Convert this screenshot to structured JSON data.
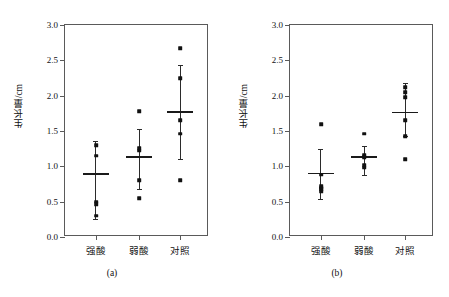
{
  "figure": {
    "ylabel": "生长量/cm",
    "categories": [
      "强酸",
      "弱酸",
      "对照"
    ],
    "yticks": [
      "0.0",
      "0.5",
      "1.0",
      "1.5",
      "2.0",
      "2.5",
      "3.0"
    ],
    "captions": {
      "a": "(a)",
      "b": "(b)"
    }
  },
  "chart_data": {
    "type": "scatter",
    "title": "",
    "xlabel": "",
    "ylabel": "生长量/cm",
    "ylim": [
      0.0,
      3.0
    ],
    "ytick_values": [
      0.0,
      0.5,
      1.0,
      1.5,
      2.0,
      2.5,
      3.0
    ],
    "grid": false,
    "legend": "none",
    "categories": [
      "强酸",
      "弱酸",
      "对照"
    ],
    "panels": [
      {
        "label": "(a)",
        "groups": [
          {
            "category": "强酸",
            "mean": 0.89,
            "whisker_low": 0.25,
            "whisker_high": 1.36,
            "points": [
              1.3,
              1.15,
              0.5,
              0.46,
              0.3
            ]
          },
          {
            "category": "弱酸",
            "mean": 1.13,
            "whisker_low": 0.68,
            "whisker_high": 1.53,
            "points": [
              1.78,
              1.26,
              1.22,
              0.8,
              0.55
            ]
          },
          {
            "category": "对照",
            "mean": 1.77,
            "whisker_low": 1.1,
            "whisker_high": 2.43,
            "points": [
              2.67,
              2.25,
              1.65,
              1.46,
              0.8
            ]
          }
        ]
      },
      {
        "label": "(b)",
        "groups": [
          {
            "category": "强酸",
            "mean": 0.9,
            "whisker_low": 0.54,
            "whisker_high": 1.24,
            "points": [
              1.6,
              0.88,
              0.72,
              0.7,
              0.68,
              0.65
            ]
          },
          {
            "category": "弱酸",
            "mean": 1.13,
            "whisker_low": 0.88,
            "whisker_high": 1.29,
            "points": [
              1.46,
              1.16,
              1.13,
              1.02,
              0.98
            ]
          },
          {
            "category": "对照",
            "mean": 1.76,
            "whisker_low": 1.43,
            "whisker_high": 2.18,
            "points": [
              2.12,
              2.05,
              1.98,
              1.65,
              1.43,
              1.1
            ]
          }
        ]
      }
    ]
  }
}
